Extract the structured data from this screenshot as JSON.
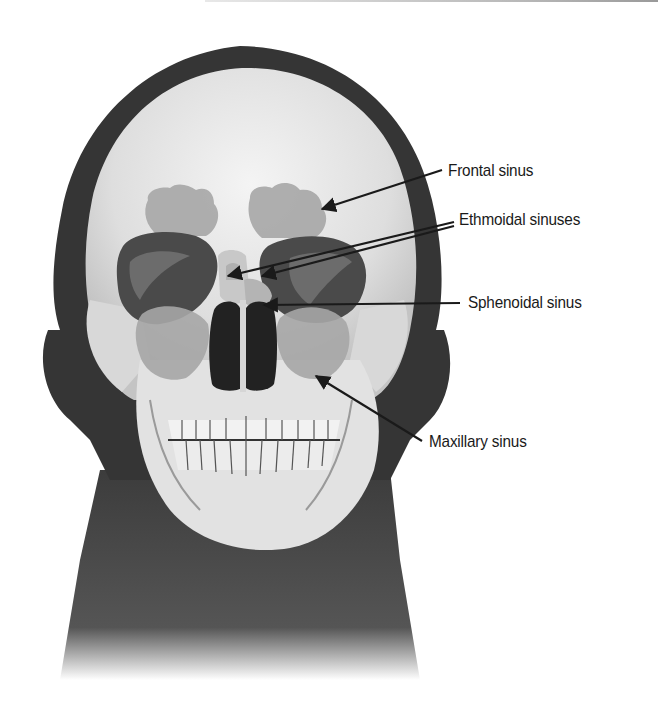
{
  "figure": {
    "labels": [
      {
        "id": "frontal",
        "text": "Frontal sinus"
      },
      {
        "id": "ethmoidal",
        "text": "Ethmoidal sinuses"
      },
      {
        "id": "sphenoidal",
        "text": "Sphenoidal sinus"
      },
      {
        "id": "maxillary",
        "text": "Maxillary sinus"
      }
    ]
  },
  "colors": {
    "background": "#ffffff",
    "silhouette": "#3a3a3a",
    "bone": "#e6e6e6",
    "sinus": "#a9a9a9",
    "text": "#1a1a1a"
  }
}
